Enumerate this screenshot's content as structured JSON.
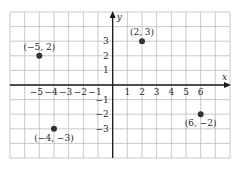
{
  "chart_data": {
    "type": "scatter",
    "title": "",
    "xlabel": "x",
    "ylabel": "y",
    "xlim": [
      -7,
      8
    ],
    "ylim": [
      -5,
      5
    ],
    "grid": true,
    "x_ticks": [
      -5,
      -4,
      -3,
      -2,
      -1,
      1,
      2,
      3,
      4,
      5,
      6
    ],
    "x_tick_labels": [
      "−5",
      "−4",
      "−3",
      "−2",
      "−1",
      "1",
      "2",
      "3",
      "4",
      "5",
      "6"
    ],
    "y_ticks": [
      3,
      2,
      1,
      -1,
      -2,
      -3
    ],
    "y_tick_labels": [
      "3",
      "2",
      "1",
      "−1",
      "−2",
      "−3"
    ],
    "points": [
      {
        "x": -5,
        "y": 2,
        "label": "(−5, 2)",
        "label_pos": "above"
      },
      {
        "x": 2,
        "y": 3,
        "label": "(2, 3)",
        "label_pos": "above"
      },
      {
        "x": -4,
        "y": -3,
        "label": "(−4, −3)",
        "label_pos": "below"
      },
      {
        "x": 6,
        "y": -2,
        "label": "(6, −2)",
        "label_pos": "below"
      }
    ]
  },
  "colors": {
    "grid": "#bdbdbd",
    "axis": "#1a1a1a",
    "point": "#333333",
    "text": "#2a2a2a"
  }
}
